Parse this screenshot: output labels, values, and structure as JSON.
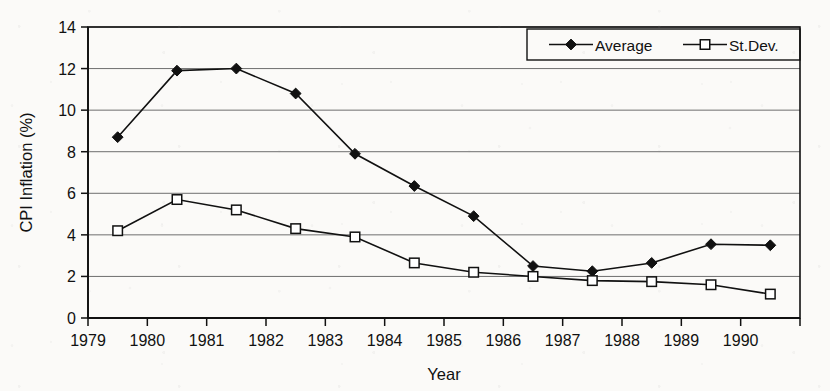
{
  "chart_data": {
    "type": "line",
    "title": "",
    "xlabel": "Year",
    "ylabel": "CPI Inflation (%)",
    "x": [
      1979.5,
      1980.5,
      1981.5,
      1982.5,
      1983.5,
      1984.5,
      1985.5,
      1986.5,
      1987.5,
      1988.5,
      1989.5,
      1990.5
    ],
    "xlim": [
      1979,
      1991
    ],
    "ylim": [
      0,
      14
    ],
    "xticks": [
      1979,
      1980,
      1981,
      1982,
      1983,
      1984,
      1985,
      1986,
      1987,
      1988,
      1989,
      1990,
      1991
    ],
    "xtick_labels": [
      "1979",
      "1980",
      "1981",
      "1982",
      "1983",
      "1984",
      "1985",
      "1986",
      "1987",
      "1988",
      "1989",
      "1990",
      ""
    ],
    "yticks": [
      0,
      2,
      4,
      6,
      8,
      10,
      12,
      14
    ],
    "ytick_labels": [
      "0",
      "2",
      "4",
      "6",
      "8",
      "10",
      "12",
      "14"
    ],
    "grid": "horizontal",
    "legend_position": "top-right",
    "series": [
      {
        "name": "Average",
        "marker": "filled-diamond",
        "values": [
          8.7,
          11.9,
          12.0,
          10.8,
          7.9,
          6.35,
          4.9,
          2.5,
          2.25,
          2.65,
          3.55,
          3.5
        ]
      },
      {
        "name": "St.Dev.",
        "marker": "open-square",
        "values": [
          4.2,
          5.7,
          5.2,
          4.3,
          3.9,
          2.65,
          2.2,
          2.0,
          1.8,
          1.75,
          1.6,
          1.15
        ]
      }
    ]
  },
  "legend": {
    "entries": [
      {
        "label": "Average"
      },
      {
        "label": "St.Dev."
      }
    ]
  },
  "colors": {
    "ink": "#111111",
    "grid": "#6e6e6e",
    "paper": "#fbfaf8"
  }
}
